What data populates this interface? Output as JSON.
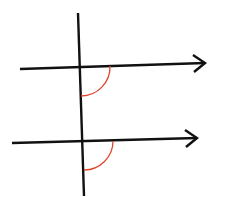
{
  "diagram": {
    "colors": {
      "line": "#111111",
      "arc": "#e0452c",
      "background": "#ffffff"
    },
    "transversal": {
      "x1": 78,
      "y1": 13,
      "x2": 84,
      "y2": 196
    },
    "parallel_lines": [
      {
        "x1": 20,
        "y1": 69,
        "x2": 205,
        "y2": 63
      },
      {
        "x1": 12,
        "y1": 143,
        "x2": 197,
        "y2": 138
      }
    ],
    "angle_arcs": [
      {
        "sx": 110,
        "sy": 66,
        "ex": 81,
        "ey": 96,
        "r": 29
      },
      {
        "sx": 113,
        "sy": 141,
        "ex": 84,
        "ey": 170,
        "r": 29
      }
    ]
  }
}
